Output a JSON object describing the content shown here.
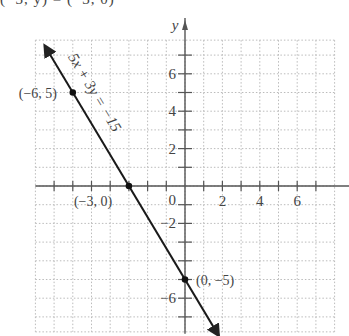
{
  "caption_fragment": "(−3, y) = (−3, 0)",
  "chart_data": {
    "type": "line",
    "title": "",
    "xlabel": "",
    "ylabel": "y",
    "equation_label": "5x + 3y = −15",
    "xlim": [
      -8,
      8
    ],
    "ylim": [
      -7.8,
      7.8
    ],
    "grid": true,
    "grid_style": "dotted",
    "x_tick_labels": [
      "2",
      "4",
      "6"
    ],
    "x_tick_values": [
      2,
      4,
      6
    ],
    "y_tick_labels": [
      "6",
      "4",
      "2",
      "−2",
      "−6"
    ],
    "y_tick_values": [
      6,
      4,
      2,
      -2,
      -6
    ],
    "origin_label": "0",
    "series": [
      {
        "name": "5x + 3y = −15",
        "x": [
          -7.5,
          1.8
        ],
        "y": [
          7.5,
          -8.0
        ],
        "arrows": "both"
      }
    ],
    "points": [
      {
        "x": -6,
        "y": 5,
        "label": "(−6, 5)"
      },
      {
        "x": -3,
        "y": 0,
        "label": "(−3, 0)"
      },
      {
        "x": 0,
        "y": -5,
        "label": "(0, −5)"
      }
    ]
  }
}
